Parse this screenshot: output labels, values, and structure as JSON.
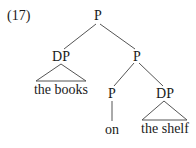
{
  "example_number": "(17)",
  "tree": {
    "root": {
      "label": "P"
    },
    "left_dp": {
      "label": "DP",
      "terminal": "the books"
    },
    "right_p": {
      "label": "P"
    },
    "inner_p": {
      "label": "P",
      "terminal": "on"
    },
    "inner_dp": {
      "label": "DP",
      "terminal": "the shelf"
    }
  },
  "colors": {
    "line": "#555555",
    "text": "#1a1a1a"
  }
}
